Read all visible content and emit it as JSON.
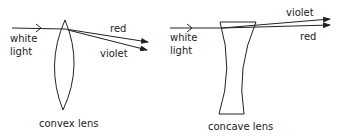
{
  "diagram": {
    "convex": {
      "caption": "convex lens",
      "input_label_line1": "white",
      "input_label_line2": "light",
      "ray_labels": {
        "red": "red",
        "violet": "violet"
      }
    },
    "concave": {
      "caption": "concave lens",
      "input_label_line1": "white",
      "input_label_line2": "light",
      "ray_labels": {
        "violet": "violet",
        "red": "red"
      }
    },
    "colors": {
      "stroke": "#222222",
      "background": "#ffffff"
    }
  }
}
